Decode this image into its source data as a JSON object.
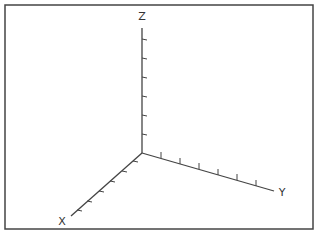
{
  "diagram": {
    "type": "3d-axes",
    "frame": {
      "x": 5,
      "y": 5,
      "width": 308,
      "height": 224,
      "stroke": "#444444"
    },
    "origin": {
      "x": 142,
      "y": 153
    },
    "axis_color": "#444444",
    "axes": [
      {
        "name": "Z",
        "label": "Z",
        "end": {
          "x": 142,
          "y": 28
        },
        "label_pos": {
          "x": 142,
          "y": 20
        },
        "ticks": [
          {
            "x": 142,
            "y": 39
          },
          {
            "x": 142,
            "y": 58
          },
          {
            "x": 142,
            "y": 77
          },
          {
            "x": 142,
            "y": 96
          },
          {
            "x": 142,
            "y": 115
          },
          {
            "x": 142,
            "y": 134
          }
        ],
        "tick_dx": 5,
        "tick_dy": 1
      },
      {
        "name": "Y",
        "label": "Y",
        "end": {
          "x": 274,
          "y": 191
        },
        "label_pos": {
          "x": 282,
          "y": 196
        },
        "ticks": [
          {
            "x": 161,
            "y": 158
          },
          {
            "x": 180,
            "y": 164
          },
          {
            "x": 199,
            "y": 169
          },
          {
            "x": 218,
            "y": 175
          },
          {
            "x": 237,
            "y": 180
          },
          {
            "x": 256,
            "y": 186
          }
        ],
        "tick_dx": 0,
        "tick_dy": -6
      },
      {
        "name": "X",
        "label": "X",
        "end": {
          "x": 71,
          "y": 216
        },
        "label_pos": {
          "x": 62,
          "y": 225
        },
        "ticks": [
          {
            "x": 133,
            "y": 161
          },
          {
            "x": 122,
            "y": 171
          },
          {
            "x": 110,
            "y": 181
          },
          {
            "x": 99,
            "y": 191
          },
          {
            "x": 87,
            "y": 201
          },
          {
            "x": 77,
            "y": 210
          }
        ],
        "tick_dx": 5,
        "tick_dy": 1
      }
    ]
  }
}
